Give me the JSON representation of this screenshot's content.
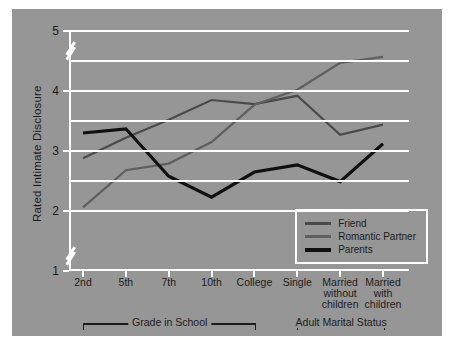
{
  "chart_data": {
    "type": "line",
    "title": "",
    "xlabel": "",
    "ylabel": "Rated Intimate Disclosure",
    "categories": [
      "2nd",
      "5th",
      "7th",
      "10th",
      "College",
      "Single",
      "Married without children",
      "Married with children"
    ],
    "category_lines": [
      [
        "2nd"
      ],
      [
        "5th"
      ],
      [
        "7th"
      ],
      [
        "10th"
      ],
      [
        "College"
      ],
      [
        "Single"
      ],
      [
        "Married",
        "without",
        "children"
      ],
      [
        "Married",
        "with",
        "children"
      ]
    ],
    "ylim": [
      1,
      5
    ],
    "yticks": [
      1,
      2,
      3,
      4,
      5
    ],
    "ytick_labels": [
      "1",
      "2",
      "3",
      "4",
      "5"
    ],
    "gridlines": [
      2.0,
      2.5,
      3.0,
      3.5,
      4.0,
      4.5,
      5.0
    ],
    "axis_breaks": [
      [
        1.15,
        1.35
      ],
      [
        4.55,
        4.78
      ]
    ],
    "grid": true,
    "legend_position": "lower right",
    "series": [
      {
        "name": "Friend",
        "color": "#4a4a4a",
        "width": 2.2,
        "values": [
          2.88,
          3.22,
          3.52,
          3.85,
          3.78,
          3.92,
          3.27,
          3.44
        ]
      },
      {
        "name": "Romantic Partner",
        "color": "#5f5f5f",
        "width": 2.2,
        "values": [
          2.06,
          2.68,
          2.79,
          3.15,
          3.77,
          4.02,
          4.47,
          4.57
        ]
      },
      {
        "name": "Parents",
        "color": "#101010",
        "width": 3.2,
        "values": [
          3.3,
          3.37,
          2.58,
          2.23,
          2.65,
          2.77,
          2.49,
          3.12
        ]
      }
    ],
    "group_brackets": [
      {
        "label": "Grade in School",
        "from": "2nd",
        "to": "College"
      },
      {
        "label": "Adult Marital Status",
        "from": "Single",
        "to": "Married with children"
      }
    ]
  },
  "figure": {
    "background_color": "#969696",
    "grid_color": "#ffffff",
    "text_color": "#1c1c1c",
    "page_background": "#ffffff"
  },
  "legend": {
    "items": [
      {
        "label": "Friend",
        "color": "#4a4a4a"
      },
      {
        "label": "Romantic Partner",
        "color": "#5f5f5f"
      },
      {
        "label": "Parents",
        "color": "#101010"
      }
    ]
  }
}
